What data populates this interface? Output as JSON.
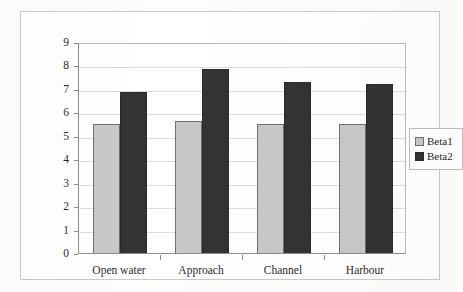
{
  "chart_data": {
    "type": "bar",
    "title": "",
    "subtitle": "",
    "xlabel": "",
    "ylabel": "",
    "categories": [
      "Open water",
      "Approach",
      "Channel",
      "Harbour"
    ],
    "series": [
      {
        "name": "Beta1",
        "color": "#c8c8c8",
        "values": [
          5.5,
          5.65,
          5.5,
          5.5
        ]
      },
      {
        "name": "Beta2",
        "color": "#333333",
        "values": [
          6.85,
          7.85,
          7.3,
          7.2
        ]
      }
    ],
    "ylim": [
      0,
      9
    ],
    "ytick_labels": [
      "0",
      "1",
      "2",
      "3",
      "4",
      "5",
      "6",
      "7",
      "8",
      "9"
    ],
    "ytick_values": [
      0,
      1,
      2,
      3,
      4,
      5,
      6,
      7,
      8,
      9
    ],
    "grid": "horizontal",
    "legend_position": "right",
    "legend_entries": [
      "Beta1",
      "Beta2"
    ]
  }
}
